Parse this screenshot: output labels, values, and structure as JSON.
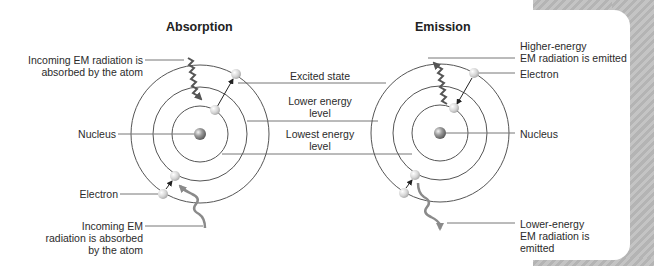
{
  "panels": {
    "absorption": {
      "title": "Absorption",
      "labels": {
        "incoming_top": [
          "Incoming EM radiation is",
          "absorbed by the atom"
        ],
        "nucleus": "Nucleus",
        "electron": "Electron",
        "incoming_bottom": [
          "Incoming EM",
          "radiation is absorbed",
          "by the atom"
        ]
      }
    },
    "emission": {
      "title": "Emission",
      "labels": {
        "higher_energy": [
          "Higher-energy",
          "EM radiation is emitted"
        ],
        "electron": "Electron",
        "nucleus": "Nucleus",
        "lower_energy": [
          "Lower-energy",
          "EM radiation is",
          "emitted"
        ]
      }
    }
  },
  "shared_labels": {
    "excited_state": "Excited state",
    "lower_energy_level": [
      "Lower energy",
      "level"
    ],
    "lowest_energy_level": [
      "Lowest energy",
      "level"
    ]
  },
  "colors": {
    "ring": "#555555",
    "leader_line": "#777777",
    "wave_dark": "#555555",
    "wave_light": "#8a8a8a",
    "electron": "#d8d8d8",
    "nucleus": "#9a9a9a",
    "background_stripe": "#bdbdbd"
  }
}
